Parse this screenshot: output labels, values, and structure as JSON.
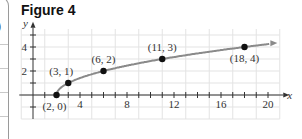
{
  "figure": {
    "title": "Figure 4",
    "left_panel_fragment": ")"
  },
  "chart_data": {
    "type": "line",
    "title": "Figure 4",
    "xlabel": "x",
    "ylabel": "y",
    "x_ticks_labeled": [
      4,
      8,
      12,
      16,
      20
    ],
    "y_ticks_labeled": [
      2,
      4
    ],
    "xlim": [
      -1,
      21
    ],
    "ylim": [
      -2,
      5.5
    ],
    "grid": true,
    "curve": "y = sqrt(x - 2), drawn from (2,0) with arrow to the right",
    "points": [
      {
        "x": 2,
        "y": 0,
        "label": "(2, 0)"
      },
      {
        "x": 3,
        "y": 1,
        "label": "(3, 1)"
      },
      {
        "x": 6,
        "y": 2,
        "label": "(6, 2)"
      },
      {
        "x": 11,
        "y": 3,
        "label": "(11, 3)"
      },
      {
        "x": 18,
        "y": 4,
        "label": "(18, 4)"
      }
    ],
    "colors": {
      "curve": "#8a8a8a",
      "points": "#111111",
      "grid": "#e3e3e3",
      "axes": "#333333"
    }
  }
}
